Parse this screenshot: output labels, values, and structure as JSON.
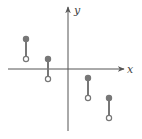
{
  "figure": {
    "label": "",
    "x_axis_label": "x",
    "y_axis_label": "y",
    "colors": {
      "axis": "#555555",
      "segment": "#777777",
      "open_dot_fill": "#ffffff"
    }
  },
  "chart_data": {
    "type": "diagram",
    "xlabel": "x",
    "ylabel": "y",
    "segments": [
      {
        "x": 26,
        "top_y": 39,
        "bottom_y": 59,
        "top": "closed",
        "bottom": "open"
      },
      {
        "x": 48,
        "top_y": 59,
        "bottom_y": 79,
        "top": "closed",
        "bottom": "open"
      },
      {
        "x": 88,
        "top_y": 78,
        "bottom_y": 98,
        "top": "closed",
        "bottom": "open"
      },
      {
        "x": 109,
        "top_y": 98,
        "bottom_y": 118,
        "top": "closed",
        "bottom": "open"
      }
    ]
  }
}
